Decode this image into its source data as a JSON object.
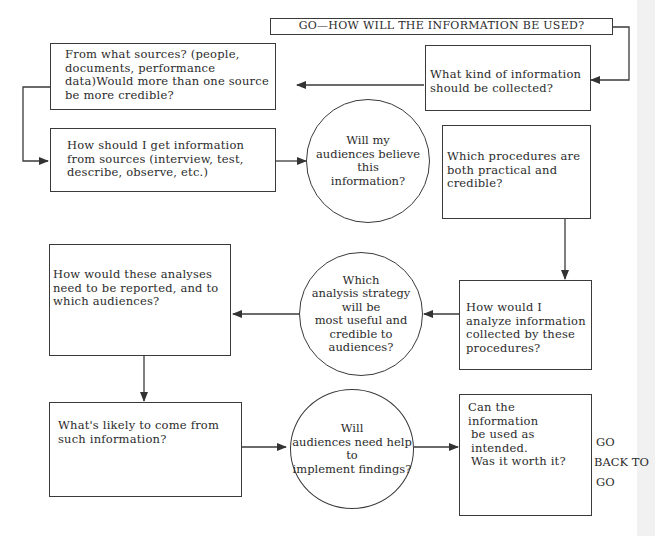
{
  "title": "GO—HOW WILL THE INFORMATION BE USED?",
  "nodes": {
    "what_kind": "What kind of information should  be collected?",
    "sources": "From what sources? (people, documents, performance data)Would more than one source be more credible?",
    "how_get": "How should I get information from sources (interview, test, describe, observe, etc.)",
    "believe": [
      "Will my",
      "audiences believe this",
      "information?"
    ],
    "procedures": "Which procedures are both practical and credible?",
    "analyze": "How would I analyze information collected by these procedures?",
    "strategy": [
      "Which",
      "analysis strategy will be",
      "most useful and",
      "credible to audiences?"
    ],
    "reported": "How would these analyses need to be reported, and to which audiences?",
    "likely": "What's likely to come from such information?",
    "help": [
      "Will",
      "audiences need help to",
      "implement findings?"
    ],
    "worth": [
      "Can the information",
      "be used as  intended.",
      "Was it worth it?"
    ]
  },
  "go_back": [
    "GO",
    "BACK TO",
    "GO"
  ],
  "colors": {
    "line": "#3a3a3a",
    "background": "#ffffff"
  }
}
